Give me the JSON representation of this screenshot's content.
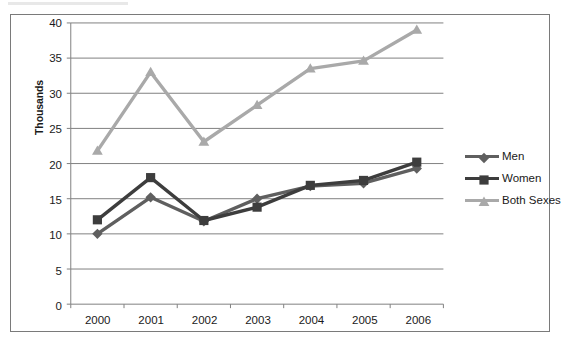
{
  "chart_data": {
    "type": "line",
    "title": "",
    "xlabel": "",
    "ylabel": "Thousands",
    "categories": [
      "2000",
      "2001",
      "2002",
      "2003",
      "2004",
      "2005",
      "2006"
    ],
    "ylim": [
      0,
      40
    ],
    "yticks": [
      "0",
      "5",
      "10",
      "15",
      "20",
      "25",
      "30",
      "35",
      "40"
    ],
    "ytick_step": 5,
    "grid": "horizontal",
    "legend_position": "right",
    "series": [
      {
        "name": "Men",
        "marker": "diamond",
        "color": "#5f5f5f",
        "values": [
          10.0,
          15.2,
          11.8,
          15.0,
          16.8,
          17.2,
          19.3
        ]
      },
      {
        "name": "Women",
        "marker": "square",
        "color": "#3d3d3d",
        "values": [
          12.0,
          18.0,
          11.9,
          13.8,
          16.9,
          17.6,
          20.2
        ]
      },
      {
        "name": "Both Sexes",
        "marker": "triangle",
        "color": "#a9a9a9",
        "values": [
          21.8,
          33.0,
          23.1,
          28.3,
          33.5,
          34.6,
          39.0
        ]
      }
    ]
  },
  "colors": {
    "frame": "#7a7a7a",
    "axis": "#808080",
    "gridline": "#808080",
    "tick_text": "#1a1a1a",
    "background": "#ffffff"
  }
}
